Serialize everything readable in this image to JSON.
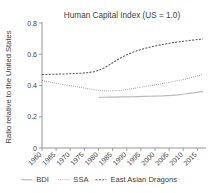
{
  "chart_data": {
    "type": "line",
    "title": "Human Capital Index (US = 1.0)",
    "xlabel": "",
    "ylabel": "Ratio relative to the United States",
    "xlim": [
      1960,
      2017
    ],
    "ylim": [
      0,
      0.8
    ],
    "xticks": [
      "1960",
      "1965",
      "1970",
      "1975",
      "1980",
      "1985",
      "1990",
      "1995",
      "2000",
      "2005",
      "2010",
      "2015"
    ],
    "yticks": [
      "0",
      "0.2",
      "0.4",
      "0.6",
      "0.8"
    ],
    "grid": false,
    "legend_position": "bottom",
    "series": [
      {
        "name": "BDI",
        "style": "solid",
        "color": "#b9b9b9",
        "x": [
          1980,
          1982,
          1984,
          1986,
          1988,
          1990,
          1992,
          1994,
          1996,
          1998,
          2000,
          2002,
          2004,
          2006,
          2008,
          2010,
          2012,
          2014,
          2016,
          2017
        ],
        "values": [
          0.325,
          0.325,
          0.326,
          0.326,
          0.327,
          0.327,
          0.328,
          0.329,
          0.33,
          0.331,
          0.332,
          0.333,
          0.335,
          0.337,
          0.34,
          0.344,
          0.349,
          0.354,
          0.359,
          0.361
        ]
      },
      {
        "name": "SSA",
        "style": "dotted",
        "color": "#6f6f6f",
        "x": [
          1960,
          1962,
          1964,
          1966,
          1968,
          1970,
          1972,
          1974,
          1976,
          1978,
          1980,
          1982,
          1984,
          1986,
          1988,
          1990,
          1992,
          1994,
          1996,
          1998,
          2000,
          2002,
          2004,
          2006,
          2008,
          2010,
          2012,
          2014,
          2016,
          2017
        ],
        "values": [
          0.432,
          0.425,
          0.418,
          0.411,
          0.405,
          0.399,
          0.393,
          0.387,
          0.381,
          0.375,
          0.369,
          0.366,
          0.365,
          0.366,
          0.369,
          0.374,
          0.38,
          0.386,
          0.392,
          0.398,
          0.404,
          0.41,
          0.417,
          0.424,
          0.431,
          0.438,
          0.447,
          0.456,
          0.466,
          0.472
        ]
      },
      {
        "name": "East Asian Dragons",
        "style": "dashed",
        "color": "#5a5a5a",
        "x": [
          1960,
          1962,
          1964,
          1966,
          1968,
          1970,
          1972,
          1974,
          1976,
          1978,
          1980,
          1982,
          1984,
          1986,
          1988,
          1990,
          1992,
          1994,
          1996,
          1998,
          2000,
          2002,
          2004,
          2006,
          2008,
          2010,
          2012,
          2014,
          2016,
          2017
        ],
        "values": [
          0.47,
          0.471,
          0.472,
          0.473,
          0.474,
          0.475,
          0.477,
          0.479,
          0.482,
          0.487,
          0.496,
          0.512,
          0.534,
          0.557,
          0.578,
          0.597,
          0.612,
          0.625,
          0.636,
          0.645,
          0.653,
          0.66,
          0.667,
          0.673,
          0.678,
          0.683,
          0.688,
          0.692,
          0.696,
          0.698
        ]
      }
    ],
    "legend": [
      {
        "label": "BDI",
        "style": "solid",
        "color": "#b9b9b9"
      },
      {
        "label": "SSA",
        "style": "dotted",
        "color": "#6f6f6f"
      },
      {
        "label": "East Asian Dragons",
        "style": "dashed",
        "color": "#5a5a5a"
      }
    ]
  }
}
